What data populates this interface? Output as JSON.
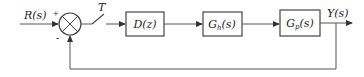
{
  "diagram": {
    "type": "sampled-data feedback control block diagram",
    "input": {
      "label": "R(s)"
    },
    "summing_junction": {
      "plus_sign": "+",
      "minus_sign": "-"
    },
    "sampler": {
      "label": "T"
    },
    "blocks": [
      {
        "id": "controller",
        "main": "D",
        "sub": "",
        "arg": "(z)"
      },
      {
        "id": "hold",
        "main": "G",
        "sub": "h",
        "arg": "(s)"
      },
      {
        "id": "plant",
        "main": "G",
        "sub": "p",
        "arg": "(s)"
      }
    ],
    "output": {
      "label": "Y(s)"
    },
    "feedback": {
      "type": "unity negative feedback"
    },
    "colors": {
      "line": "#555555",
      "text": "#222222",
      "background": "#ffffff"
    }
  }
}
